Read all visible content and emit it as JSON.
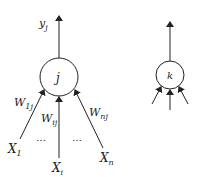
{
  "diagram": {
    "type": "neuron-model",
    "colors": {
      "stroke": "#222222",
      "background": "#ffffff"
    },
    "neuron_j": {
      "label": "j",
      "output_label": "y",
      "output_sub": "j",
      "inputs": [
        {
          "label": "X",
          "sub": "1",
          "weight": "W",
          "weight_sub": "1j"
        },
        {
          "label": "X",
          "sub": "i",
          "weight": "W",
          "weight_sub": "ij"
        },
        {
          "label": "X",
          "sub": "n",
          "weight": "W",
          "weight_sub": "nj"
        }
      ],
      "ellipsis_left": "…",
      "ellipsis_right": "…"
    },
    "neuron_k": {
      "label": "k"
    }
  }
}
